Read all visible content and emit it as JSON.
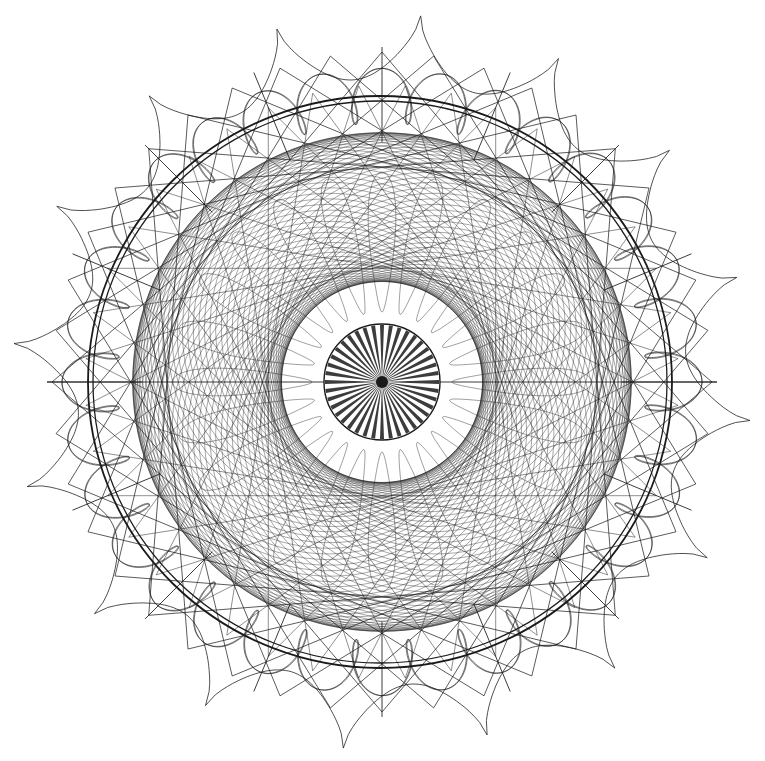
{
  "figure": {
    "kind": "spirograph-rosette-engraving",
    "ink_color": "#1a1a1a",
    "background": "#ffffff",
    "center": [
      382,
      382
    ],
    "caption": ""
  },
  "layers": {
    "scalloped_border": {
      "cusps": 16,
      "outer_radius": 370,
      "inner_radius": 305,
      "rotation_deg": -84,
      "stroke_width": 0.9,
      "opacity": 0.85
    },
    "main_ellipse": {
      "rx": 292,
      "ry": 286,
      "offsets": [
        0,
        5
      ],
      "stroke_width": 1.8
    },
    "loop_band": {
      "base_radius": 292,
      "loops": 32,
      "amplitude": 28,
      "wobble": 14,
      "stroke_width": 0.8,
      "opacity": 0.75
    },
    "chord_lattice": {
      "count": 40,
      "radius": 330,
      "skip": 11,
      "stroke_width": 0.9,
      "opacity": 0.8
    },
    "inner_spirograph": {
      "R": 60,
      "r": 23,
      "d": 195,
      "turns": 23,
      "stroke_width": 0.55,
      "opacity": 0.7
    },
    "petal_ring": {
      "petals": 24,
      "inner_radius": 70,
      "outer_radius": 210,
      "stroke_width": 0.6,
      "opacity": 0.7
    },
    "center_disk": {
      "radius": 58,
      "rays": 40,
      "stroke_width": 1.4
    },
    "radial_spikes": {
      "count": 8,
      "inner_radius": 240,
      "outer_radius": 335,
      "stroke_width": 1.0
    }
  }
}
